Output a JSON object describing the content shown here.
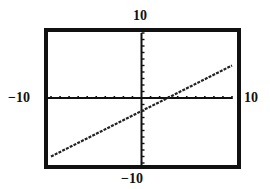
{
  "window": {
    "xmin_label": "−10",
    "xmax_label": "10",
    "ymin_label": "−10",
    "ymax_label": "10"
  },
  "colors": {
    "frame": "#111111",
    "axes": "#111111",
    "plot": "#222222",
    "background": "#ffffff"
  },
  "chart_data": {
    "type": "line",
    "title": "",
    "xlabel": "",
    "ylabel": "",
    "xlim": [
      -10,
      10
    ],
    "ylim": [
      -10,
      10
    ],
    "xscale_tick": 1,
    "yscale_tick": 1,
    "grid": false,
    "legend": null,
    "tick_labels": {
      "left": "−10",
      "right": "10",
      "top": "10",
      "bottom": "−10"
    },
    "series": [
      {
        "name": "line",
        "style": "dotted-pixel",
        "x": [
          -10,
          -5,
          0,
          2.9,
          5,
          10
        ],
        "y": [
          -9,
          -5.5,
          -2,
          0,
          1.5,
          5
        ]
      }
    ],
    "annotations": []
  }
}
